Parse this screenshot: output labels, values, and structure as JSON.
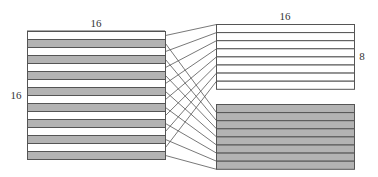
{
  "diagram": {
    "type": "interleave-split",
    "labels": {
      "left_top": "16",
      "left_side": "16",
      "right_top": "16",
      "right_side": "8"
    },
    "left_block": {
      "rows": 16,
      "pattern": "alternating",
      "first_row_fill": "white",
      "x": 27,
      "y": 31,
      "width": 138,
      "row_height": 8
    },
    "right_top_block": {
      "rows": 8,
      "fill": "white",
      "x": 216,
      "y": 24,
      "width": 138,
      "row_height": 8.1
    },
    "right_bottom_block": {
      "rows": 8,
      "fill": "gray",
      "x": 216,
      "y": 104,
      "width": 138,
      "row_height": 8.1
    },
    "mapping": {
      "white_rows": "left even rows -> right top rows in order",
      "gray_rows": "left odd rows -> right bottom rows in order"
    },
    "colors": {
      "stroke": "#555555",
      "gray_fill": "#b3b3b3",
      "white_fill": "#ffffff",
      "connector": "#555555"
    }
  }
}
